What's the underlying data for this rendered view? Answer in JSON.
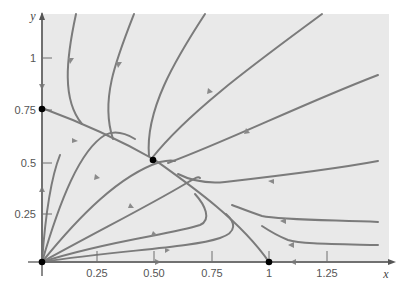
{
  "figure": {
    "type": "phase-portrait",
    "axes": {
      "x_label": "x",
      "y_label": "y",
      "x_ticks": [
        "0.25",
        "0.50",
        "0.75",
        "1",
        "1.25"
      ],
      "y_ticks": [
        "0.25",
        "0.5",
        "0.75",
        "1"
      ]
    },
    "equilibria": [
      {
        "x": 0,
        "y": 0,
        "label": "origin"
      },
      {
        "x": 0,
        "y": 0.75,
        "label": "0.75"
      },
      {
        "x": 0.5,
        "y": 0.5,
        "label": "interior"
      },
      {
        "x": 1,
        "y": 0,
        "label": "1"
      }
    ],
    "colors": {
      "background": "#e9e9e9",
      "trajectory": "#7b7b7b",
      "equilibrium": "#000000"
    }
  }
}
